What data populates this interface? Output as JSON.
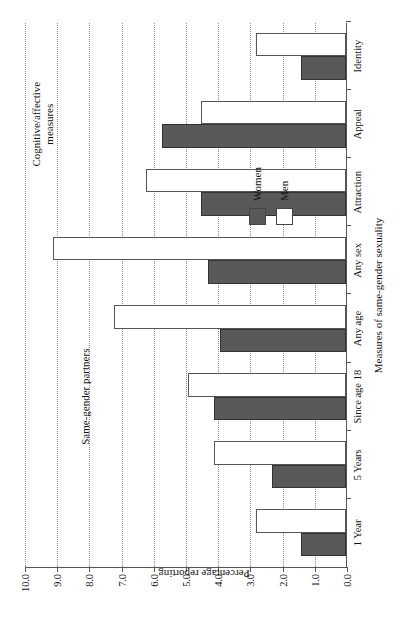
{
  "chart_data": {
    "type": "bar",
    "title": "",
    "xlabel": "Measures of same-gender sexuality",
    "ylabel": "Percentage reporting",
    "ylim": [
      0.0,
      10.0
    ],
    "ytick_labels": [
      "0.0",
      "1.0",
      "2.0",
      "3.0",
      "4.0",
      "5.0",
      "6.0",
      "7.0",
      "8.0",
      "9.0",
      "10.0"
    ],
    "ytick_values": [
      0.0,
      1.0,
      2.0,
      3.0,
      4.0,
      5.0,
      6.0,
      7.0,
      8.0,
      9.0,
      10.0
    ],
    "grid": true,
    "legend_position": "inside-right-center",
    "categories": [
      "1 Year",
      "5 Years",
      "Since age 18",
      "Any age",
      "Any sex",
      "Attraction",
      "Appeal",
      "Identity"
    ],
    "series": [
      {
        "name": "Women",
        "color": "#595959",
        "values": [
          1.4,
          2.3,
          4.1,
          3.9,
          4.3,
          4.5,
          5.7,
          1.4
        ]
      },
      {
        "name": "Men",
        "color": "#ffffff",
        "values": [
          2.8,
          4.1,
          4.9,
          7.2,
          9.1,
          6.2,
          4.5,
          2.8
        ]
      }
    ],
    "annotations": [
      {
        "text": "Same-gender partners",
        "categories": [
          "1 Year",
          "5 Years",
          "Since age 18",
          "Any age",
          "Any sex"
        ]
      },
      {
        "text": "Cognitive/affective\nmeasures",
        "categories": [
          "Attraction",
          "Appeal",
          "Identity"
        ]
      }
    ]
  },
  "legend": {
    "items": [
      {
        "label": "Women",
        "swatch": "women"
      },
      {
        "label": "Men",
        "swatch": "men"
      }
    ]
  }
}
